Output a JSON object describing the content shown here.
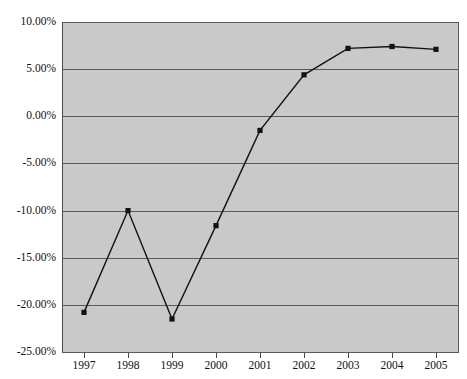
{
  "chart_data": {
    "type": "line",
    "title": "",
    "subtitle": "",
    "xlabel": "",
    "ylabel": "",
    "categories": [
      "1997",
      "1998",
      "1999",
      "2000",
      "2001",
      "2002",
      "2003",
      "2004",
      "2005"
    ],
    "x": [
      1997,
      1998,
      1999,
      2000,
      2001,
      2002,
      2003,
      2004,
      2005
    ],
    "values": [
      -20.8,
      -10.0,
      -21.5,
      -11.6,
      -1.5,
      4.4,
      7.2,
      7.4,
      7.1
    ],
    "series": [
      {
        "name": "",
        "values": [
          -20.8,
          -10.0,
          -21.5,
          -11.6,
          -1.5,
          4.4,
          7.2,
          7.4,
          7.1
        ]
      }
    ],
    "ylim": [
      -25.0,
      10.0
    ],
    "yticks": [
      10.0,
      5.0,
      0.0,
      -5.0,
      -10.0,
      -15.0,
      -20.0,
      -25.0
    ],
    "ytick_labels": [
      "10.00%",
      "5.00%",
      "0.00%",
      "-5.00%",
      "-10.00%",
      "-15.00%",
      "-20.00%",
      "-25.00%"
    ],
    "xtick_labels": [
      "1997",
      "1998",
      "1999",
      "2000",
      "2001",
      "2002",
      "2003",
      "2004",
      "2005"
    ],
    "grid": true,
    "grid_axis": "y",
    "legend": false,
    "legend_position": "none",
    "marker": "square",
    "annotations": []
  },
  "style": {
    "plot_background": "#c9c9c9",
    "page_background": "#ffffff",
    "gridline_color": "#5a5a5a",
    "axis_color": "#4a4a4a",
    "series_color": "#121212",
    "text_color": "#111111"
  }
}
